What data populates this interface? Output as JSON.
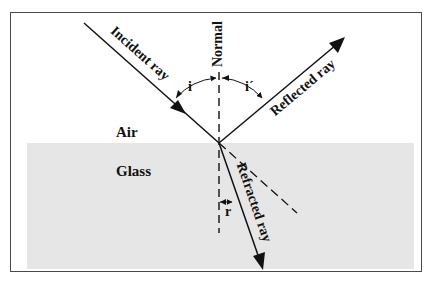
{
  "diagram": {
    "media": {
      "upper": "Air",
      "lower": "Glass"
    },
    "rays": {
      "incident": "Incident ray",
      "reflected": "Reflected ray",
      "refracted": "Refracted ray"
    },
    "normal_label": "Normal",
    "angles": {
      "incidence": "i",
      "reflection": "i´",
      "refraction": "r"
    },
    "colors": {
      "line": "#111111",
      "glass_fill": "#e6e6e6",
      "frame": "#4a4a4a"
    }
  }
}
